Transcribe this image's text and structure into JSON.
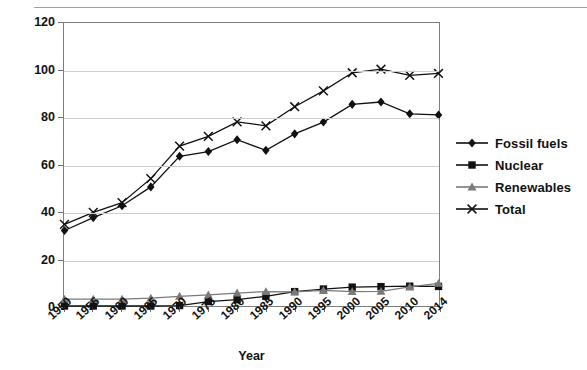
{
  "page": {
    "top_cutoff_text": "",
    "background": "#ffffff"
  },
  "chart_data": {
    "type": "line",
    "title": "",
    "subtitle": "",
    "xlabel": "Year",
    "ylabel": "Quadrillion Btus",
    "categories": [
      "1950",
      "1955",
      "1960",
      "1965",
      "1970",
      "1975",
      "1980",
      "1985",
      "1990",
      "1995",
      "2000",
      "2005",
      "2010",
      "2014"
    ],
    "x": [
      "1950",
      "1955",
      "1960",
      "1965",
      "1970",
      "1975",
      "1980",
      "1985",
      "1990",
      "1995",
      "2000",
      "2005",
      "2010",
      "2014"
    ],
    "ylim": [
      0,
      120
    ],
    "yticks": [
      "0",
      "20",
      "40",
      "60",
      "80",
      "100",
      "120"
    ],
    "grid": "horizontal",
    "legend_position": "right",
    "series": [
      {
        "name": "Fossil fuels",
        "marker": "diamond",
        "color": "#111111",
        "values": [
          32.0,
          37.5,
          42.5,
          50.5,
          63.5,
          65.5,
          70.5,
          66.0,
          73.0,
          78.0,
          85.5,
          86.5,
          81.5,
          81.0
        ]
      },
      {
        "name": "Nuclear",
        "marker": "square",
        "color": "#111111",
        "values": [
          0.0,
          0.0,
          0.0,
          0.0,
          0.2,
          1.9,
          2.7,
          4.1,
          6.1,
          7.2,
          8.0,
          8.2,
          8.4,
          8.3
        ]
      },
      {
        "name": "Renewables",
        "marker": "triangle",
        "color": "#7a7a7a",
        "values": [
          2.9,
          2.9,
          2.9,
          3.3,
          4.1,
          4.7,
          5.5,
          6.1,
          6.0,
          6.6,
          6.1,
          6.2,
          8.1,
          9.6
        ]
      },
      {
        "name": "Total",
        "marker": "x",
        "color": "#111111",
        "values": [
          34.6,
          39.7,
          43.8,
          54.0,
          67.8,
          71.9,
          78.1,
          76.4,
          84.5,
          91.2,
          98.9,
          100.4,
          97.8,
          98.6
        ]
      }
    ]
  },
  "legend": {
    "items": [
      {
        "label": "Fossil fuels"
      },
      {
        "label": "Nuclear"
      },
      {
        "label": "Renewables"
      },
      {
        "label": "Total"
      }
    ]
  }
}
